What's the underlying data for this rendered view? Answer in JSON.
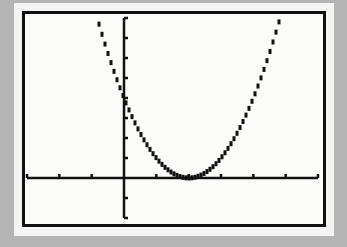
{
  "window": {
    "xmin": -3,
    "xmax": 6,
    "xscl": 1,
    "ymin": -2,
    "ymax": 8,
    "yscl": 1
  },
  "colors": {
    "background": "#b4b4b4",
    "screen": "#fbfbfa",
    "ink": "#111111"
  },
  "chart_data": {
    "type": "line",
    "title": "",
    "xlabel": "",
    "ylabel": "",
    "function": "y = (x - 2)^2",
    "xlim": [
      -3,
      6
    ],
    "ylim": [
      -2,
      8
    ],
    "grid": false,
    "legend": "none",
    "x_ticks": [
      -3,
      -2,
      -1,
      0,
      1,
      2,
      3,
      4,
      5,
      6
    ],
    "y_ticks": [
      -2,
      -1,
      0,
      1,
      2,
      3,
      4,
      5,
      6,
      7,
      8
    ],
    "series": [
      {
        "name": "Y1",
        "x": [
          -0.83,
          -0.5,
          0,
          0.5,
          1,
          1.5,
          2,
          2.5,
          3,
          3.5,
          4,
          4.5,
          4.83
        ],
        "values": [
          8,
          6.25,
          4,
          2.25,
          1,
          0.25,
          0,
          0.25,
          1,
          2.25,
          4,
          6.25,
          8
        ]
      }
    ],
    "key_points": {
      "vertex": [
        2,
        0
      ],
      "y_intercept": [
        0,
        4
      ]
    }
  }
}
